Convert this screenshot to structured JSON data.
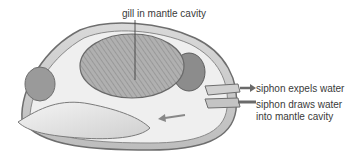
{
  "diagram": {
    "labels": {
      "gill": "gill in mantle cavity",
      "siphon_expels": "siphon expels water",
      "siphon_draws_line1": "siphon draws water",
      "siphon_draws_line2": "into mantle cavity"
    },
    "colors": {
      "shell_outline": "#6e6e6e",
      "gill_fill": "#a8a8a8",
      "body_fill": "#e6e6e6",
      "muscle_fill": "#8c8c8c",
      "text": "#3a3a3a",
      "arrow": "#6a6a6a"
    }
  }
}
